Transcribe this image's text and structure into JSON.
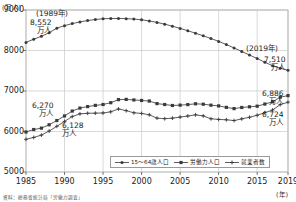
{
  "chart_data": {
    "type": "line",
    "title": "",
    "xlabel": "(年)",
    "ylabel": "(万人)",
    "xlim": [
      1985,
      2019
    ],
    "ylim": [
      5000,
      9000
    ],
    "yticks": [
      5000,
      6000,
      7000,
      8000,
      9000
    ],
    "xticks": [
      1985,
      1990,
      1995,
      2000,
      2005,
      2010,
      2015,
      2019
    ],
    "grid": true,
    "legend_position": "bottom-right",
    "x": [
      1985,
      1986,
      1987,
      1988,
      1989,
      1990,
      1991,
      1992,
      1993,
      1994,
      1995,
      1996,
      1997,
      1998,
      1999,
      2000,
      2001,
      2002,
      2003,
      2004,
      2005,
      2006,
      2007,
      2008,
      2009,
      2010,
      2011,
      2012,
      2013,
      2014,
      2015,
      2016,
      2017,
      2018,
      2019
    ],
    "series": [
      {
        "name": "15〜64歳人口",
        "marker": "dot",
        "values": [
          8200,
          8280,
          8350,
          8440,
          8552,
          8614,
          8664,
          8706,
          8740,
          8766,
          8784,
          8790,
          8792,
          8786,
          8776,
          8758,
          8730,
          8694,
          8650,
          8600,
          8546,
          8488,
          8427,
          8363,
          8296,
          8225,
          8147,
          8063,
          7976,
          7889,
          7801,
          7709,
          7625,
          7562,
          7510
        ]
      },
      {
        "name": "労働力人口",
        "marker": "square",
        "values": [
          5988,
          6049,
          6083,
          6166,
          6270,
          6384,
          6505,
          6578,
          6615,
          6645,
          6666,
          6711,
          6787,
          6793,
          6779,
          6766,
          6752,
          6689,
          6666,
          6642,
          6651,
          6664,
          6684,
          6674,
          6650,
          6632,
          6596,
          6565,
          6593,
          6609,
          6625,
          6678,
          6732,
          6849,
          6886
        ]
      },
      {
        "name": "就業者数",
        "marker": "cross",
        "values": [
          5807,
          5853,
          5911,
          6011,
          6128,
          6249,
          6369,
          6436,
          6450,
          6453,
          6457,
          6486,
          6557,
          6514,
          6462,
          6446,
          6412,
          6330,
          6316,
          6329,
          6356,
          6382,
          6412,
          6385,
          6314,
          6298,
          6289,
          6270,
          6311,
          6351,
          6401,
          6465,
          6530,
          6664,
          6724
        ]
      }
    ],
    "annotations": [
      {
        "id": "peak-1989",
        "year_label": "(1989年)",
        "value": "8,552",
        "unit": "万人"
      },
      {
        "id": "start-1989-labor",
        "value": "6,270",
        "unit": "万人"
      },
      {
        "id": "start-1989-employed",
        "value": "6,128",
        "unit": "万人"
      },
      {
        "id": "end-2019-pop",
        "year_label": "(2019年)",
        "value": "7,510",
        "unit": "万人"
      },
      {
        "id": "end-2019-labor",
        "value": "6,886",
        "unit": "万人"
      },
      {
        "id": "end-2019-employed",
        "value": "6,724",
        "unit": "万人"
      }
    ]
  },
  "axis": {
    "y_unit": "(万人)",
    "x_unit": "(年)"
  },
  "legend": {
    "items": [
      {
        "label": "15〜64歳人口",
        "marker": "dot"
      },
      {
        "label": "労働力人口",
        "marker": "square"
      },
      {
        "label": "就業者数",
        "marker": "cross"
      }
    ]
  },
  "source": {
    "text": "資料：総務省統計局「労働力調査」"
  }
}
